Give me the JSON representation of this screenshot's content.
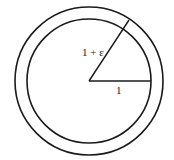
{
  "diagram": {
    "inner_circle": {
      "radius_label": "1"
    },
    "outer_circle": {
      "radius_label": "1 + ε"
    },
    "colors": {
      "stroke": "#1a1a1a",
      "background": "#ffffff"
    }
  }
}
